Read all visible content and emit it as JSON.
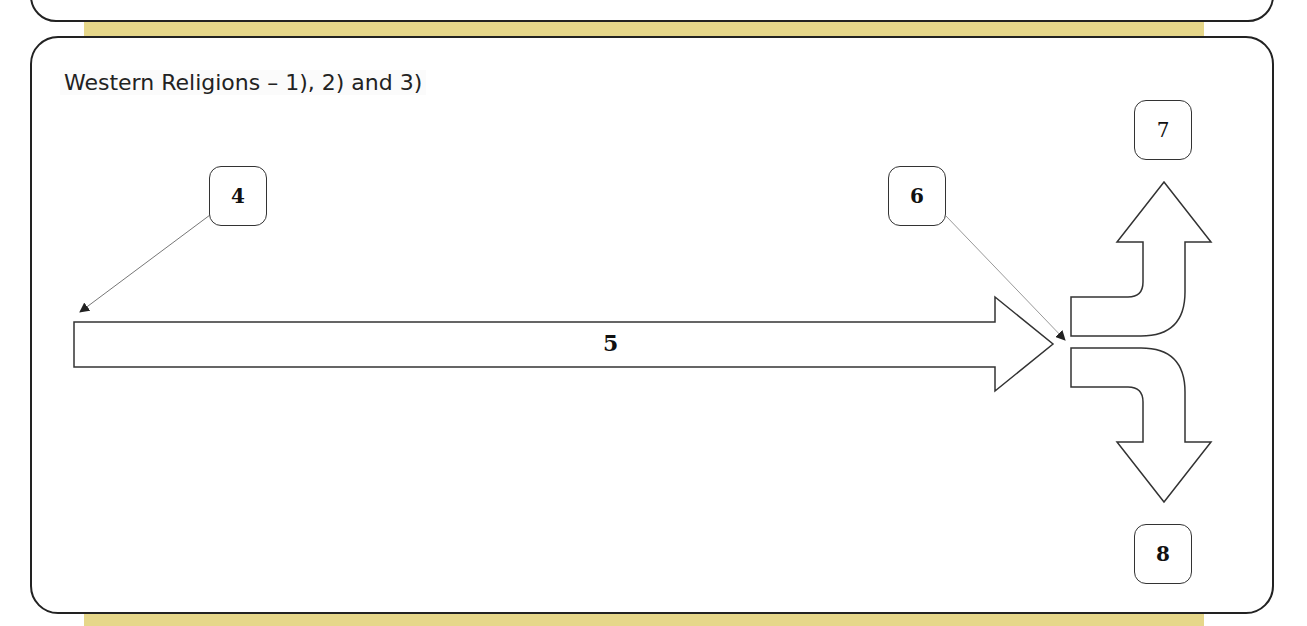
{
  "section": {
    "title": "Western Religions – 1), 2) and 3)"
  },
  "diagram": {
    "main_arrow_label": "5",
    "callouts": [
      {
        "id": "box-4",
        "label": "4",
        "points_to": "start of main arrow"
      },
      {
        "id": "box-6",
        "label": "6",
        "points_to": "end of main arrow / split point"
      },
      {
        "id": "box-7",
        "label": "7",
        "position": "above upward branch arrow"
      },
      {
        "id": "box-8",
        "label": "8",
        "position": "below downward branch arrow"
      }
    ],
    "branches": [
      "up",
      "down"
    ]
  },
  "colors": {
    "band": "#e6d78a",
    "border": "#222222",
    "background": "#ffffff"
  }
}
